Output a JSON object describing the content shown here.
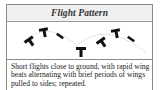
{
  "card": {
    "title": "Flight Pattern",
    "illustration": {
      "icon": "undulating-flight-path-icon",
      "description": "dashed undulating flight path with bird silhouettes"
    },
    "description": "Short flights close to ground, with rapid wing beats alternating with brief periods of wings pulled to sides; repeated."
  }
}
